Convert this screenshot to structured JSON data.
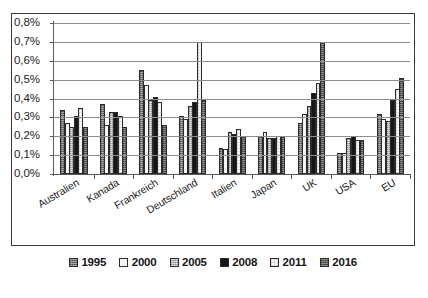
{
  "chart_data": {
    "type": "bar",
    "title": "",
    "subtitle": "",
    "xlabel": "",
    "ylabel": "",
    "ylim": [
      0,
      0.8
    ],
    "ytick_step": 0.1,
    "ytick_labels": [
      "0,0%",
      "0,1%",
      "0,2%",
      "0,3%",
      "0,4%",
      "0,5%",
      "0,6%",
      "0,7%",
      "0,8%"
    ],
    "ytick_values": [
      0.0,
      0.1,
      0.2,
      0.3,
      0.4,
      0.5,
      0.6,
      0.7,
      0.8
    ],
    "grid": true,
    "grid_axis": "y",
    "legend_position": "bottom",
    "value_unit": "percent",
    "decimal_separator": ",",
    "categories": [
      "Australien",
      "Kanada",
      "Frankreich",
      "Deutschland",
      "Italien",
      "Japan",
      "UK",
      "USA",
      "EU"
    ],
    "series": [
      {
        "name": "1995",
        "color": "#6e6e6e",
        "pattern": "dense-speckle",
        "values": [
          0.34,
          0.37,
          0.55,
          0.31,
          0.14,
          0.2,
          0.27,
          0.11,
          0.32
        ]
      },
      {
        "name": "2000",
        "color": "#f4f4f4",
        "pattern": "solid-white",
        "values": [
          0.27,
          0.26,
          0.47,
          0.29,
          0.13,
          0.22,
          0.32,
          0.11,
          0.29
        ]
      },
      {
        "name": "2005",
        "color": "#b6b6b6",
        "pattern": "light-speckle",
        "values": [
          0.25,
          0.33,
          0.39,
          0.36,
          0.22,
          0.19,
          0.36,
          0.19,
          0.28
        ]
      },
      {
        "name": "2008",
        "color": "#161616",
        "pattern": "solid-black",
        "values": [
          0.31,
          0.33,
          0.41,
          0.38,
          0.21,
          0.19,
          0.43,
          0.2,
          0.39
        ]
      },
      {
        "name": "2011",
        "color": "#fbfbfb",
        "pattern": "faint-dots",
        "values": [
          0.35,
          0.31,
          0.38,
          0.7,
          0.24,
          0.2,
          0.48,
          0.18,
          0.45
        ]
      },
      {
        "name": "2016",
        "color": "#555555",
        "pattern": "dark-speckle",
        "values": [
          0.25,
          0.25,
          0.26,
          0.39,
          0.2,
          0.2,
          0.7,
          0.18,
          0.51
        ]
      }
    ]
  }
}
